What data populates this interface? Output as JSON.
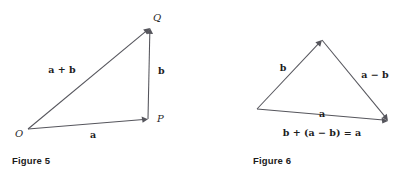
{
  "page": {
    "background_color": "#ffffff",
    "ink_color": "#55555c",
    "text_color": "#1d1d1d"
  },
  "figures": [
    {
      "id": "figure-5",
      "caption": "Figure 5",
      "points": [
        {
          "name": "O",
          "label": "O",
          "x": 28,
          "y": 129
        },
        {
          "name": "P",
          "label": "P",
          "x": 148,
          "y": 119
        },
        {
          "name": "Q",
          "label": "Q",
          "x": 150,
          "y": 28
        }
      ],
      "vectors": [
        {
          "name": "a",
          "label": "a",
          "from": "O",
          "to": "P",
          "label_x": 93,
          "label_y": 138
        },
        {
          "name": "b",
          "label": "b",
          "from": "P",
          "to": "Q",
          "label_x": 158,
          "label_y": 74
        },
        {
          "name": "a-plus-b",
          "label": "a + b",
          "from": "O",
          "to": "Q",
          "label_x": 62,
          "label_y": 73
        }
      ]
    },
    {
      "id": "figure-6",
      "caption": "Figure 6",
      "points": [
        {
          "name": "left-vertex",
          "label": "",
          "x": 57,
          "y": 109
        },
        {
          "name": "apex",
          "label": "",
          "x": 122,
          "y": 40
        },
        {
          "name": "right-vertex",
          "label": "",
          "x": 188,
          "y": 121
        }
      ],
      "vectors": [
        {
          "name": "b",
          "label": "b",
          "from": "left-vertex",
          "to": "apex",
          "label_x": 83,
          "label_y": 71
        },
        {
          "name": "a-minus-b",
          "label": "a − b",
          "from": "apex",
          "to": "right-vertex",
          "label_x": 175,
          "label_y": 78
        },
        {
          "name": "a",
          "label": "a",
          "from": "left-vertex",
          "to": "right-vertex",
          "label_x": 122,
          "label_y": 117
        }
      ],
      "identity": {
        "name": "vector-identity",
        "text": "b + (a − b) = a",
        "label_x": 122,
        "label_y": 136
      }
    }
  ]
}
